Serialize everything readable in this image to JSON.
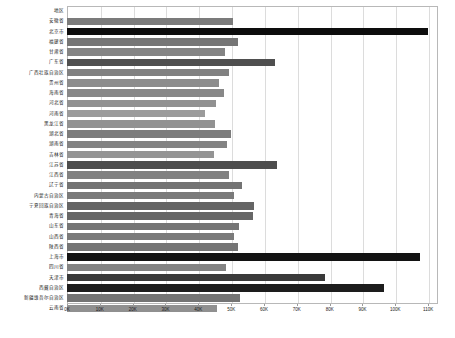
{
  "chart_data": {
    "type": "bar",
    "orientation": "horizontal",
    "title": "",
    "xlabel": "",
    "ylabel": "",
    "header_label": "地区",
    "xlim": [
      0,
      113000
    ],
    "grid": true,
    "legend": null,
    "xticks": [
      {
        "value": 0,
        "label": "0K"
      },
      {
        "value": 10000,
        "label": "10K"
      },
      {
        "value": 20000,
        "label": "20K"
      },
      {
        "value": 30000,
        "label": "30K"
      },
      {
        "value": 40000,
        "label": "40K"
      },
      {
        "value": 50000,
        "label": "50K"
      },
      {
        "value": 60000,
        "label": "60K"
      },
      {
        "value": 70000,
        "label": "70K"
      },
      {
        "value": 80000,
        "label": "80K"
      },
      {
        "value": 90000,
        "label": "90K"
      },
      {
        "value": 100000,
        "label": "100K"
      },
      {
        "value": 110000,
        "label": "110K"
      }
    ],
    "categories": [
      "安徽省",
      "北京市",
      "福建省",
      "甘肃省",
      "广东省",
      "广西壮族自治区",
      "贵州省",
      "海南省",
      "河北省",
      "河南省",
      "黑龙江省",
      "湖北省",
      "湖南省",
      "吉林省",
      "江苏省",
      "江西省",
      "辽宁省",
      "内蒙古自治区",
      "宁夏回族自治区",
      "青海省",
      "山东省",
      "山西省",
      "陕西省",
      "上海市",
      "四川省",
      "天津市",
      "西藏自治区",
      "新疆维吾尔自治区",
      "云南省"
    ],
    "values": [
      50600,
      110000,
      52100,
      48200,
      63500,
      49400,
      46300,
      47700,
      45500,
      41900,
      45200,
      50100,
      48700,
      44900,
      64000,
      49300,
      53300,
      50800,
      57100,
      56800,
      52300,
      50800,
      52200,
      107500,
      48400,
      78700,
      96500,
      52700,
      45700
    ],
    "bar_colors": [
      "#7b7b7b",
      "#0d0d0d",
      "#767676",
      "#848484",
      "#4f4f4f",
      "#818181",
      "#8c8c8c",
      "#888888",
      "#919191",
      "#9b9b9b",
      "#929292",
      "#7c7c7c",
      "#838383",
      "#949494",
      "#4d4d4d",
      "#818181",
      "#737373",
      "#7a7a7a",
      "#656565",
      "#676767",
      "#757575",
      "#7a7a7a",
      "#757575",
      "#131313",
      "#838383",
      "#3a3a3a",
      "#1d1d1d",
      "#747474",
      "#909090"
    ]
  },
  "style": {
    "grid_color": "#dcdcdc",
    "frame_color": "#b8b8b8",
    "background": "#ffffff",
    "text_color": "#1a1a1a"
  }
}
